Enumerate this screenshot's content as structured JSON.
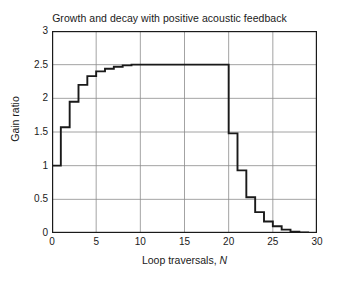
{
  "chart_data": {
    "type": "line",
    "line_style": "step-post",
    "title": "Growth and decay with positive acoustic feedback",
    "xlabel_prefix": "Loop traversals, ",
    "xlabel_var": "N",
    "ylabel": "Gain ratio",
    "xlim": [
      0,
      30
    ],
    "ylim": [
      0,
      3
    ],
    "xticks": [
      0,
      5,
      10,
      15,
      20,
      25,
      30
    ],
    "xticklabels": [
      "0",
      "5",
      "10",
      "15",
      "20",
      "25",
      "30"
    ],
    "yticks": [
      0,
      0.5,
      1,
      1.5,
      2,
      2.5,
      3
    ],
    "yticklabels": [
      "0",
      "0.5",
      "1",
      "1.5",
      "2",
      "2.5",
      "3"
    ],
    "grid": true,
    "grid_color": "#8c8c8c",
    "line_color": "#1a1a1a",
    "frame_color": "#1a1a1a",
    "background": "#ffffff",
    "legend": null,
    "x": [
      0,
      1,
      2,
      3,
      4,
      5,
      6,
      7,
      8,
      9,
      10,
      11,
      12,
      13,
      14,
      15,
      16,
      17,
      18,
      19,
      20,
      21,
      22,
      23,
      24,
      25,
      26,
      27,
      28,
      29,
      30
    ],
    "values": [
      1.0,
      1.57,
      1.95,
      2.2,
      2.33,
      2.4,
      2.44,
      2.47,
      2.49,
      2.5,
      2.5,
      2.5,
      2.5,
      2.5,
      2.5,
      2.5,
      2.5,
      2.5,
      2.5,
      2.5,
      1.48,
      0.93,
      0.53,
      0.31,
      0.17,
      0.1,
      0.05,
      0.02,
      0.01,
      0.0,
      0.0
    ]
  }
}
